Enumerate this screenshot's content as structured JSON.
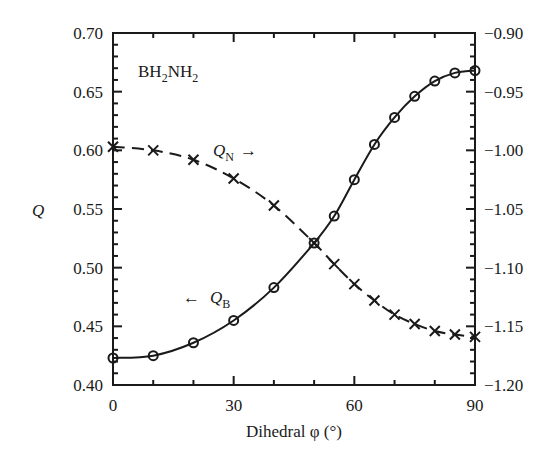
{
  "chart_data": {
    "type": "line",
    "title": "",
    "annotation_label": "BH2NH2",
    "xlabel": "Dihedral φ (°)",
    "ylabel": "Q",
    "ylabel_right": "",
    "xlim": [
      0,
      90
    ],
    "ylim": [
      0.4,
      0.7
    ],
    "ylim_right": [
      -1.2,
      -0.9
    ],
    "grid": false,
    "legend": "inline annotations",
    "x_ticks": [
      0,
      30,
      60,
      90
    ],
    "x_tick_labels": [
      "0",
      "30",
      "60",
      "90"
    ],
    "y_ticks": [
      0.4,
      0.45,
      0.5,
      0.55,
      0.6,
      0.65,
      0.7
    ],
    "y_tick_labels": [
      "0.40",
      "0.45",
      "0.50",
      "0.55",
      "0.60",
      "0.65",
      "0.70"
    ],
    "y_right_ticks": [
      -1.2,
      -1.15,
      -1.1,
      -1.05,
      -1.0,
      -0.95,
      -0.9
    ],
    "y_right_tick_labels": [
      "−1.20",
      "−1.15",
      "−1.10",
      "−1.05",
      "−1.00",
      "−0.95",
      "−0.90"
    ],
    "x": [
      0,
      10,
      20,
      30,
      40,
      50,
      55,
      60,
      65,
      70,
      75,
      80,
      85,
      90
    ],
    "series": [
      {
        "name": "Q_B",
        "label_main": "Q",
        "label_sub": "B",
        "arrow": "←",
        "axis": "left",
        "marker": "circle",
        "line_style": "solid",
        "values": [
          0.423,
          0.425,
          0.436,
          0.455,
          0.483,
          0.521,
          0.544,
          0.575,
          0.605,
          0.628,
          0.646,
          0.659,
          0.666,
          0.668
        ]
      },
      {
        "name": "Q_N",
        "label_main": "Q",
        "label_sub": "N",
        "arrow": "→",
        "axis": "right",
        "marker": "cross",
        "line_style": "dashed",
        "values": [
          -0.997,
          -1.0,
          -1.008,
          -1.024,
          -1.047,
          -1.079,
          -1.097,
          -1.114,
          -1.128,
          -1.14,
          -1.148,
          -1.154,
          -1.157,
          -1.159
        ]
      }
    ]
  },
  "labels": {
    "molecule_main1": "BH",
    "molecule_sub1": "2",
    "molecule_main2": "NH",
    "molecule_sub2": "2",
    "ylabel": "Q",
    "xlabel": "Dihedral φ (°)"
  }
}
